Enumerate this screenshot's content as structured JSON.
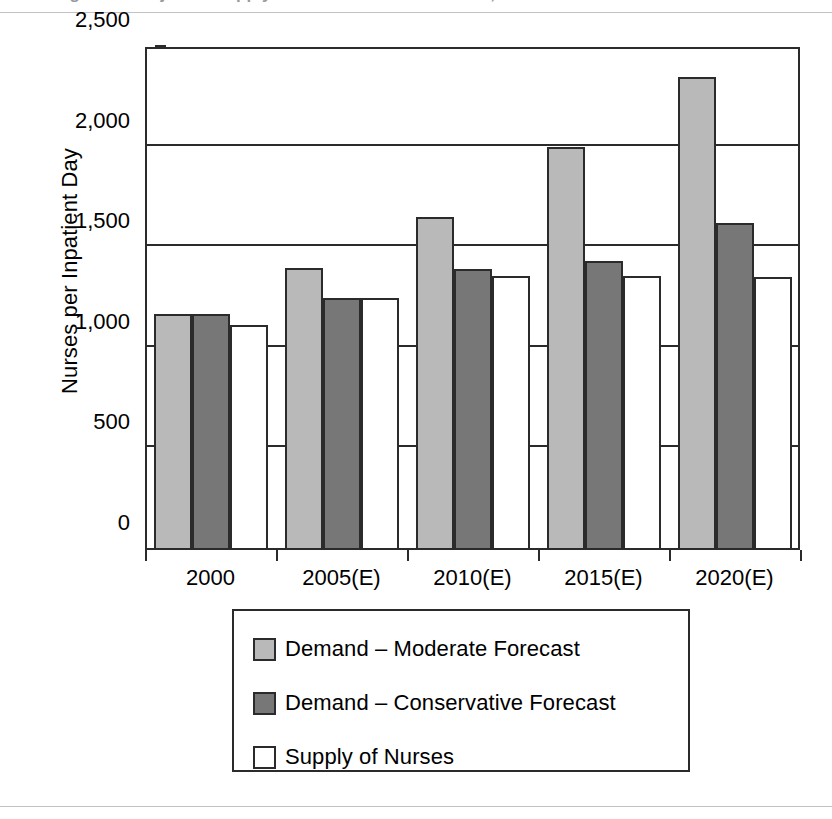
{
  "figure": {
    "caption_sliver": "Figure 3. Projected supply of and demand for nurses, 2000–2020"
  },
  "chart_data": {
    "type": "bar",
    "title": "",
    "xlabel": "",
    "ylabel": "Nurses per Inpatient Day",
    "categories": [
      "2000",
      "2005(E)",
      "2010(E)",
      "2015(E)",
      "2020(E)"
    ],
    "series": [
      {
        "name": "Demand – Moderate Forecast",
        "color": "#b9b9b9",
        "values": [
          1175,
          1400,
          1655,
          2005,
          2350
        ]
      },
      {
        "name": "Demand – Conservative Forecast",
        "color": "#777777",
        "values": [
          1175,
          1255,
          1395,
          1435,
          1625
        ]
      },
      {
        "name": "Supply of Nurses",
        "color": "#ffffff",
        "values": [
          1120,
          1255,
          1360,
          1360,
          1355
        ]
      }
    ],
    "ylim": [
      0,
      2500
    ],
    "yticks": [
      0,
      500,
      1000,
      1500,
      2000,
      2500
    ],
    "ytick_labels": [
      "0",
      "500",
      "1,000",
      "1,500",
      "2,000",
      "2,500"
    ],
    "grid": true,
    "legend_position": "bottom-center",
    "bar_border_color": "#2b2b2b"
  }
}
